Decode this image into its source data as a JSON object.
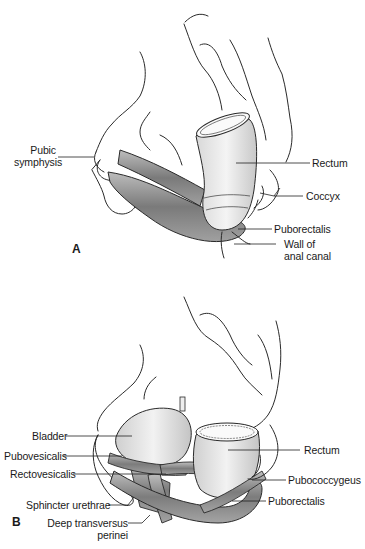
{
  "figure": {
    "panels": [
      {
        "letter": "A",
        "labels": {
          "pubic_symphysis_1": "Pubic",
          "pubic_symphysis_2": "symphysis",
          "rectum": "Rectum",
          "coccyx": "Coccyx",
          "puborectalis": "Puborectalis",
          "wall_1": "Wall of",
          "wall_2": "anal canal"
        }
      },
      {
        "letter": "B",
        "labels": {
          "bladder": "Bladder",
          "pubovesicalis": "Pubovesicalis",
          "rectovesicalis": "Rectovesicalis",
          "sphincter_urethrae": "Sphincter urethrae",
          "deep_transversus_1": "Deep transversus",
          "deep_transversus_2": "perinei",
          "rectum": "Rectum",
          "pubococcygeus": "Pubococcygeus",
          "puborectalis": "Puborectalis"
        }
      }
    ]
  },
  "colors": {
    "line": "#2a2a2a",
    "muscle_fill": "#9a9a9a",
    "organ_fill": "#e6e6e6",
    "background": "#ffffff"
  }
}
